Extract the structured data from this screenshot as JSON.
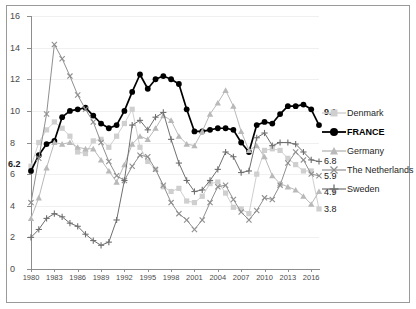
{
  "chart_data": {
    "type": "line",
    "title": "",
    "xlabel": "",
    "ylabel": "",
    "ylim": [
      0,
      16
    ],
    "ytick_labels": [
      "0",
      "2",
      "4",
      "6",
      "8",
      "10",
      "12",
      "14",
      "16"
    ],
    "ytick_values": [
      0,
      2,
      4,
      6,
      8,
      10,
      12,
      14,
      16
    ],
    "grid": true,
    "legend_position": "right",
    "x": [
      1980,
      1981,
      1982,
      1983,
      1984,
      1985,
      1986,
      1987,
      1988,
      1989,
      1990,
      1991,
      1992,
      1993,
      1994,
      1995,
      1996,
      1997,
      1998,
      1999,
      2000,
      2001,
      2002,
      2003,
      2004,
      2005,
      2006,
      2007,
      2008,
      2009,
      2010,
      2011,
      2012,
      2013,
      2014,
      2015,
      2016,
      2017
    ],
    "xtick_labels": [
      "1980",
      "1983",
      "1986",
      "1989",
      "1992",
      "1995",
      "1998",
      "2001",
      "2004",
      "2007",
      "2010",
      "2013",
      "2016"
    ],
    "xtick_values": [
      1980,
      1983,
      1986,
      1989,
      1992,
      1995,
      1998,
      2001,
      2004,
      2007,
      2010,
      2013,
      2016
    ],
    "series": [
      {
        "name": "Denmark",
        "color": "#cfcfcf",
        "marker": "square",
        "end_label": "3.8",
        "values": [
          6.5,
          8.0,
          8.8,
          9.3,
          8.9,
          8.4,
          7.4,
          7.3,
          8.1,
          8.2,
          7.7,
          8.4,
          9.2,
          10.1,
          7.7,
          6.8,
          6.3,
          5.2,
          4.9,
          5.1,
          4.3,
          4.2,
          4.6,
          5.4,
          5.5,
          4.8,
          3.9,
          3.8,
          3.5,
          6.0,
          7.5,
          7.6,
          7.5,
          7.0,
          6.6,
          6.2,
          6.2,
          3.8
        ]
      },
      {
        "name": "FRANCE",
        "color": "#000000",
        "marker": "circle",
        "start_label": "6.2",
        "end_label": "9.1",
        "values": [
          6.2,
          7.2,
          7.9,
          8.1,
          9.6,
          10.0,
          10.1,
          10.2,
          9.7,
          9.2,
          8.9,
          9.1,
          10.0,
          11.2,
          12.3,
          11.4,
          12.0,
          12.2,
          12.0,
          11.7,
          10.1,
          8.7,
          8.7,
          8.8,
          8.9,
          8.9,
          8.8,
          8.0,
          7.4,
          9.1,
          9.3,
          9.2,
          9.8,
          10.3,
          10.3,
          10.4,
          10.1,
          9.1
        ]
      },
      {
        "name": "Germany",
        "color": "#b9b9b9",
        "marker": "triangle",
        "end_label": "4.9",
        "values": [
          3.2,
          4.5,
          6.4,
          8.0,
          7.9,
          8.0,
          7.7,
          7.6,
          7.6,
          6.9,
          6.2,
          5.5,
          6.6,
          7.9,
          8.4,
          8.2,
          8.9,
          9.7,
          9.4,
          8.4,
          7.9,
          7.8,
          8.7,
          9.8,
          10.5,
          11.3,
          10.3,
          8.7,
          7.5,
          7.8,
          7.1,
          5.9,
          5.4,
          5.2,
          5.0,
          4.6,
          4.1,
          4.9
        ]
      },
      {
        "name": "The Netherlands",
        "color": "#8f8f8f",
        "marker": "cross",
        "end_label": "5.9",
        "values": [
          4.2,
          7.0,
          9.8,
          14.2,
          13.3,
          12.2,
          11.0,
          10.1,
          9.3,
          8.0,
          6.8,
          5.9,
          5.6,
          6.5,
          7.2,
          7.1,
          6.3,
          5.3,
          4.2,
          3.5,
          3.1,
          2.5,
          3.1,
          4.2,
          5.2,
          5.3,
          4.4,
          3.6,
          3.1,
          3.7,
          4.5,
          4.4,
          5.3,
          6.7,
          7.4,
          6.9,
          6.0,
          5.9
        ]
      },
      {
        "name": "Sweden",
        "color": "#6f6f6f",
        "marker": "plus",
        "end_label": "6.8",
        "values": [
          2.0,
          2.5,
          3.2,
          3.5,
          3.3,
          2.9,
          2.7,
          2.2,
          1.8,
          1.5,
          1.7,
          3.1,
          5.6,
          9.1,
          9.4,
          8.8,
          9.6,
          9.9,
          8.2,
          6.7,
          5.6,
          4.9,
          5.0,
          5.6,
          6.3,
          7.4,
          7.1,
          6.1,
          6.2,
          8.3,
          8.6,
          7.8,
          8.0,
          8.0,
          7.9,
          7.4,
          6.9,
          6.8
        ]
      }
    ],
    "end_labels": [
      {
        "text": "9.1",
        "series": "FRANCE",
        "bold": true
      },
      {
        "text": "6.8",
        "series": "Sweden",
        "bold": false
      },
      {
        "text": "5.9",
        "series": "The Netherlands",
        "bold": false
      },
      {
        "text": "4.9",
        "series": "Germany",
        "bold": false
      },
      {
        "text": "3.8",
        "series": "Denmark",
        "bold": false
      }
    ],
    "start_labels": [
      {
        "text": "6.2",
        "series": "FRANCE",
        "bold": true
      }
    ]
  },
  "legend": {
    "items": [
      {
        "label": "Denmark",
        "bold": false
      },
      {
        "label": "FRANCE",
        "bold": true
      },
      {
        "label": "Germany",
        "bold": false
      },
      {
        "label": "The Netherlands",
        "bold": false
      },
      {
        "label": "Sweden",
        "bold": false
      }
    ]
  },
  "axis": {
    "y_labels": [
      "16",
      "14",
      "12",
      "10",
      "8",
      "6",
      "4",
      "2",
      "0"
    ],
    "x_labels": [
      "1980",
      "1983",
      "1986",
      "1989",
      "1992",
      "1995",
      "1998",
      "2001",
      "2004",
      "2007",
      "2010",
      "2013",
      "2016"
    ]
  },
  "annotations": {
    "france_start": "6.2",
    "france_end": "9.1",
    "sweden_end": "6.8",
    "netherlands_end": "5.9",
    "germany_end": "4.9",
    "denmark_end": "3.8"
  }
}
